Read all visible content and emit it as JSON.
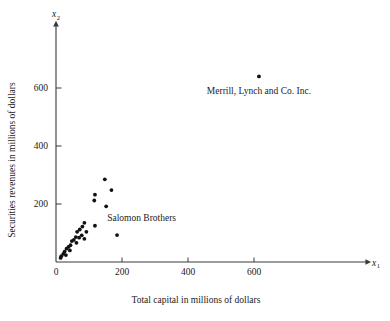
{
  "chart_data": {
    "type": "scatter",
    "title": "",
    "xlabel": "Total capital in millions of dollars",
    "ylabel": "Securities revenues in millions of dollars",
    "x_axis_symbol": "x",
    "x_axis_subscript": "1",
    "y_axis_symbol": "x",
    "y_axis_subscript": "2",
    "xlim": [
      0,
      800
    ],
    "ylim": [
      0,
      700
    ],
    "xticks": [
      0,
      200,
      400,
      600
    ],
    "xtick_labels": [
      "0",
      "200",
      "400",
      "600"
    ],
    "yticks": [
      200,
      400,
      600
    ],
    "ytick_labels": [
      "200",
      "400",
      "600"
    ],
    "y_origin_label": "0",
    "grid": false,
    "legend": "none",
    "marker_color": "#111111",
    "axis_color": "#3a3a3a",
    "points": [
      {
        "x": 615,
        "y": 640,
        "label": "Merrill, Lynch and Co. Inc."
      },
      {
        "x": 185,
        "y": 93,
        "label": "Salomon Brothers"
      },
      {
        "x": 148,
        "y": 285,
        "label": ""
      },
      {
        "x": 168,
        "y": 248,
        "label": ""
      },
      {
        "x": 118,
        "y": 232,
        "label": ""
      },
      {
        "x": 116,
        "y": 212,
        "label": ""
      },
      {
        "x": 152,
        "y": 192,
        "label": ""
      },
      {
        "x": 86,
        "y": 135,
        "label": ""
      },
      {
        "x": 118,
        "y": 125,
        "label": ""
      },
      {
        "x": 80,
        "y": 122,
        "label": ""
      },
      {
        "x": 92,
        "y": 104,
        "label": ""
      },
      {
        "x": 72,
        "y": 112,
        "label": ""
      },
      {
        "x": 64,
        "y": 104,
        "label": ""
      },
      {
        "x": 78,
        "y": 92,
        "label": ""
      },
      {
        "x": 70,
        "y": 84,
        "label": ""
      },
      {
        "x": 86,
        "y": 80,
        "label": ""
      },
      {
        "x": 60,
        "y": 86,
        "label": ""
      },
      {
        "x": 54,
        "y": 76,
        "label": ""
      },
      {
        "x": 48,
        "y": 72,
        "label": ""
      },
      {
        "x": 62,
        "y": 66,
        "label": ""
      },
      {
        "x": 44,
        "y": 58,
        "label": ""
      },
      {
        "x": 38,
        "y": 52,
        "label": ""
      },
      {
        "x": 32,
        "y": 46,
        "label": ""
      },
      {
        "x": 42,
        "y": 40,
        "label": ""
      },
      {
        "x": 26,
        "y": 36,
        "label": ""
      },
      {
        "x": 22,
        "y": 28,
        "label": ""
      },
      {
        "x": 30,
        "y": 24,
        "label": ""
      },
      {
        "x": 16,
        "y": 20,
        "label": ""
      },
      {
        "x": 14,
        "y": 14,
        "label": ""
      }
    ],
    "annotations": [
      {
        "name": "merrill-lynch",
        "text": "Merrill, Lynch and Co. Inc.",
        "x": 615,
        "y": 580
      },
      {
        "name": "salomon-brothers",
        "text": "Salomon Brothers",
        "x": 155,
        "y": 140
      }
    ]
  }
}
